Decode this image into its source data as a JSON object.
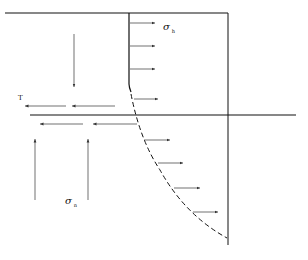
{
  "diagram": {
    "type": "stress diagram",
    "labels": {
      "sigma_h": {
        "symbol": "σ",
        "subscript": "h"
      },
      "sigma_n": {
        "symbol": "σ",
        "subscript": "n"
      },
      "tau": {
        "symbol": "T"
      }
    },
    "colors": {
      "line": "#111111",
      "arrow": "#333333",
      "background": "#ffffff"
    }
  }
}
